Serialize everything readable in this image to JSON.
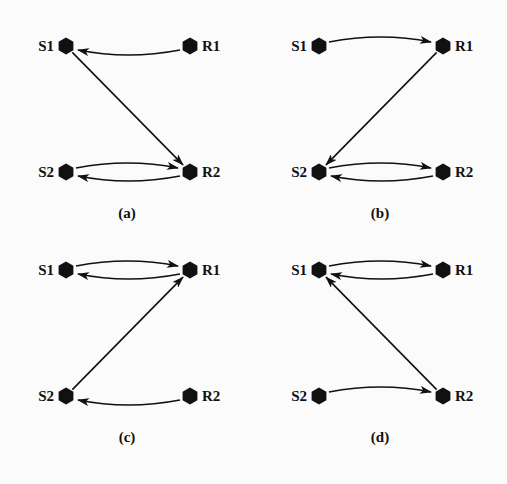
{
  "figure": {
    "panels": [
      {
        "caption": "(a)",
        "nodes": [
          "S1",
          "R1",
          "S2",
          "R2"
        ],
        "edges": [
          {
            "from": "R1",
            "to": "S1",
            "shape": "curve-down"
          },
          {
            "from": "S1",
            "to": "R2",
            "shape": "straight"
          },
          {
            "from": "S2",
            "to": "R2",
            "shape": "curve-up"
          },
          {
            "from": "R2",
            "to": "S2",
            "shape": "curve-down"
          }
        ]
      },
      {
        "caption": "(b)",
        "nodes": [
          "S1",
          "R1",
          "S2",
          "R2"
        ],
        "edges": [
          {
            "from": "S1",
            "to": "R1",
            "shape": "curve-up"
          },
          {
            "from": "R1",
            "to": "S2",
            "shape": "straight"
          },
          {
            "from": "S2",
            "to": "R2",
            "shape": "curve-up"
          },
          {
            "from": "R2",
            "to": "S2",
            "shape": "curve-down"
          }
        ]
      },
      {
        "caption": "(c)",
        "nodes": [
          "S1",
          "R1",
          "S2",
          "R2"
        ],
        "edges": [
          {
            "from": "S1",
            "to": "R1",
            "shape": "curve-up"
          },
          {
            "from": "R1",
            "to": "S1",
            "shape": "curve-down"
          },
          {
            "from": "S2",
            "to": "R1",
            "shape": "straight"
          },
          {
            "from": "R2",
            "to": "S2",
            "shape": "curve-down"
          }
        ]
      },
      {
        "caption": "(d)",
        "nodes": [
          "S1",
          "R1",
          "S2",
          "R2"
        ],
        "edges": [
          {
            "from": "S1",
            "to": "R1",
            "shape": "curve-up"
          },
          {
            "from": "R1",
            "to": "S1",
            "shape": "curve-down"
          },
          {
            "from": "R2",
            "to": "S1",
            "shape": "straight"
          },
          {
            "from": "S2",
            "to": "R2",
            "shape": "curve-up"
          }
        ]
      }
    ],
    "colors": {
      "ink": "#111111",
      "background": "#fbfbfb"
    }
  }
}
